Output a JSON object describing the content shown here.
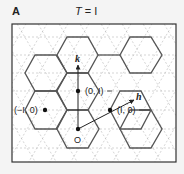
{
  "panel": {
    "label": "A",
    "title_var": "T",
    "title_eq": " = ",
    "title_val": "I"
  },
  "lattice": {
    "points": [
      {
        "label": "(0, I)",
        "x": 78,
        "y": 91
      },
      {
        "label": "(−I, 0)",
        "x": 45,
        "y": 110
      },
      {
        "label": "(I, 0)",
        "x": 110,
        "y": 110
      },
      {
        "label": "O",
        "x": 78,
        "y": 129
      }
    ],
    "vectors": [
      {
        "name": "k",
        "label": "k"
      },
      {
        "name": "h",
        "label": "h"
      }
    ]
  },
  "colors": {
    "hex_stroke": "#555555",
    "grid_stroke": "#b5b5b5",
    "frame": "#333333",
    "background": "#ffffff"
  }
}
